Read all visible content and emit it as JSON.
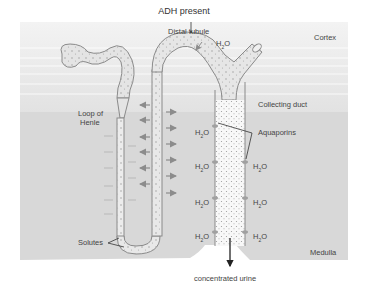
{
  "title": "ADH present",
  "regions": {
    "cortex": "Cortex",
    "medulla": "Medulla"
  },
  "labels": {
    "distal_tubule": "Distal tubule",
    "collecting_duct": "Collecting duct",
    "loop_of_henle_line1": "Loop of",
    "loop_of_henle_line2": "Henle",
    "aquaporins": "Aquaporins",
    "solutes": "Solutes",
    "output": "concentrated urine"
  },
  "water": {
    "base": "H",
    "sub": "2",
    "tail": "O"
  },
  "colors": {
    "cortex_bg": "#eeeeee",
    "medulla_bg": "#d6d6d6",
    "tubule_fill": "#e6e6e6",
    "tubule_stroke": "#8a8a8a",
    "duct_fill": "#f7f7f7",
    "arrow": "#8c8c8c",
    "text": "#444444"
  }
}
